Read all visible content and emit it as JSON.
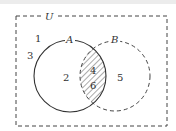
{
  "diagram": {
    "type": "venn",
    "universe_label": "U",
    "sets": [
      {
        "name": "A",
        "style": "solid"
      },
      {
        "name": "B",
        "style": "dashed"
      }
    ],
    "regions": {
      "outside": [
        "1",
        "3"
      ],
      "a_only": [
        "2"
      ],
      "intersection": [
        "4",
        "6"
      ],
      "b_only": [
        "5"
      ]
    },
    "shaded_region": "intersection",
    "colors": {
      "stroke": "#333333",
      "hatch": "#555555",
      "background": "#ffffff"
    }
  }
}
